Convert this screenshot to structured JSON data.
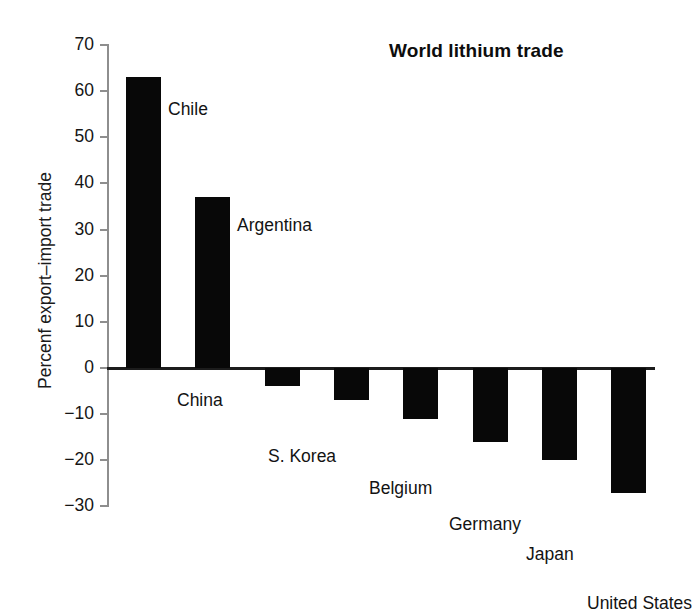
{
  "chart_data": {
    "type": "bar",
    "title": "World lithium trade",
    "xlabel": "",
    "ylabel": "Percenf export–import trade",
    "categories": [
      "Chile",
      "Argentina",
      "China",
      "S. Korea",
      "Belgium",
      "Germany",
      "Japan",
      "United States"
    ],
    "values": [
      63,
      37,
      -4,
      -7,
      -11,
      -16,
      -20,
      -27
    ],
    "ylim": [
      -30,
      70
    ],
    "yticks": [
      70,
      60,
      50,
      40,
      30,
      20,
      10,
      0,
      -10,
      -20,
      -30
    ],
    "ytick_labels": [
      "70",
      "60",
      "50",
      "40",
      "30",
      "20",
      "10",
      "0",
      "−10",
      "−20",
      "−30"
    ],
    "grid": false,
    "legend": "none",
    "bar_color": "#080808",
    "axis_color": "#8e8e8e",
    "baseline_color": "#1c1c1c",
    "annotations": [
      {
        "text": "Chile",
        "value": 63
      },
      {
        "text": "Argentina",
        "value": 37
      },
      {
        "text": "China",
        "value": -4
      },
      {
        "text": "S. Korea",
        "value": -7
      },
      {
        "text": "Belgium",
        "value": -11
      },
      {
        "text": "Germany",
        "value": -16
      },
      {
        "text": "Japan",
        "value": -20
      },
      {
        "text": "United States",
        "value": -27
      }
    ]
  }
}
